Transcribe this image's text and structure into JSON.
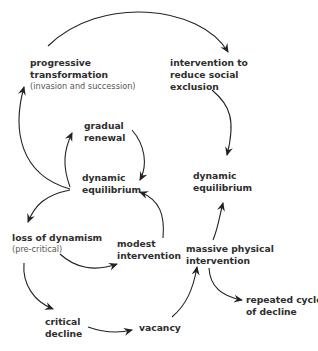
{
  "diagram": {
    "type": "cycle-flow",
    "nodes": [
      {
        "id": "progressive_transformation",
        "lines": [
          "progressive",
          "transformation"
        ],
        "sub": "(invasion and succession)"
      },
      {
        "id": "intervention_social",
        "lines": [
          "intervention to",
          "reduce social",
          "exclusion"
        ]
      },
      {
        "id": "gradual_renewal",
        "lines": [
          "gradual",
          "renewal"
        ]
      },
      {
        "id": "dynamic_equilibrium_left",
        "lines": [
          "dynamic",
          "equilibrium"
        ]
      },
      {
        "id": "dynamic_equilibrium_right",
        "lines": [
          "dynamic",
          "equilibrium"
        ]
      },
      {
        "id": "loss_of_dynamism",
        "lines": [
          "loss of dynamism"
        ],
        "sub": "(pre-critical)"
      },
      {
        "id": "modest_intervention",
        "lines": [
          "modest",
          "intervention"
        ]
      },
      {
        "id": "massive_physical_intervention",
        "lines": [
          "massive physical",
          "intervention"
        ]
      },
      {
        "id": "critical_decline",
        "lines": [
          "critical",
          "decline"
        ]
      },
      {
        "id": "vacancy",
        "lines": [
          "vacancy"
        ]
      },
      {
        "id": "repeated_cycle",
        "lines": [
          "repeated cycle",
          "of decline"
        ]
      }
    ],
    "edges": [
      {
        "from": "dynamic_equilibrium_left",
        "to": "gradual_renewal"
      },
      {
        "from": "gradual_renewal",
        "to": "dynamic_equilibrium_left"
      },
      {
        "from": "dynamic_equilibrium_left",
        "to": "progressive_transformation"
      },
      {
        "from": "progressive_transformation",
        "to": "intervention_social"
      },
      {
        "from": "intervention_social",
        "to": "dynamic_equilibrium_right"
      },
      {
        "from": "dynamic_equilibrium_left",
        "to": "loss_of_dynamism"
      },
      {
        "from": "loss_of_dynamism",
        "to": "modest_intervention"
      },
      {
        "from": "modest_intervention",
        "to": "dynamic_equilibrium_left"
      },
      {
        "from": "loss_of_dynamism",
        "to": "critical_decline"
      },
      {
        "from": "critical_decline",
        "to": "vacancy"
      },
      {
        "from": "vacancy",
        "to": "massive_physical_intervention"
      },
      {
        "from": "massive_physical_intervention",
        "to": "dynamic_equilibrium_right"
      },
      {
        "from": "massive_physical_intervention",
        "to": "repeated_cycle"
      }
    ],
    "colors": {
      "text": "#2e2e2e",
      "subtext": "#555555",
      "arrow": "#222222",
      "background": "#ffffff"
    }
  }
}
